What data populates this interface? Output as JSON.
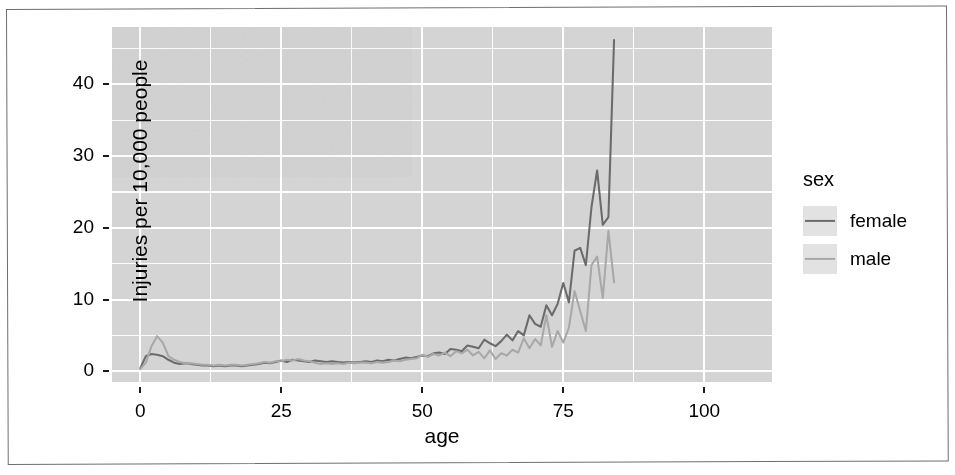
{
  "figure": {
    "background": "#ffffff",
    "panel_background": "#d4d4d4",
    "gridline_color": "#ffffff",
    "frame_color": "#6e6e6e"
  },
  "legend": {
    "title": "sex",
    "items": [
      {
        "label": "female",
        "color": "#6b6b6b",
        "key_name": "legend-key-female"
      },
      {
        "label": "male",
        "color": "#a8a8a8",
        "key_name": "legend-key-male"
      }
    ]
  },
  "axes": {
    "x_title": "age",
    "y_title": "Injuries per 10,000 people",
    "x_ticks": [
      "0",
      "25",
      "50",
      "75",
      "100"
    ],
    "y_ticks": [
      "0",
      "10",
      "20",
      "30",
      "40"
    ]
  },
  "chart_data": {
    "type": "line",
    "title": "",
    "subtitle": "",
    "xlabel": "age",
    "ylabel": "Injuries per 10,000 people",
    "xlim": [
      -5,
      112
    ],
    "ylim": [
      -1.5,
      48
    ],
    "xticks": [
      0,
      25,
      50,
      75,
      100
    ],
    "yticks": [
      0,
      10,
      20,
      30,
      40
    ],
    "x_minor_ticks": [
      12.5,
      37.5,
      62.5,
      87.5
    ],
    "y_minor_ticks": [
      5,
      15,
      25,
      35,
      45
    ],
    "grid": true,
    "legend_position": "right",
    "legend_title": "sex",
    "series": [
      {
        "name": "female",
        "color": "#6b6b6b",
        "x": [
          0,
          1,
          2,
          3,
          4,
          5,
          6,
          7,
          8,
          9,
          10,
          11,
          12,
          13,
          14,
          15,
          16,
          17,
          18,
          19,
          20,
          21,
          22,
          23,
          24,
          25,
          26,
          27,
          28,
          29,
          30,
          31,
          32,
          33,
          34,
          35,
          36,
          37,
          38,
          39,
          40,
          41,
          42,
          43,
          44,
          45,
          46,
          47,
          48,
          49,
          50,
          51,
          52,
          53,
          54,
          55,
          56,
          57,
          58,
          59,
          60,
          61,
          62,
          63,
          64,
          65,
          66,
          67,
          68,
          69,
          70,
          71,
          72,
          73,
          74,
          75,
          76,
          77,
          78,
          79,
          80,
          81,
          82,
          83,
          84
        ],
        "values": [
          0.4,
          2.1,
          2.4,
          2.3,
          2.1,
          1.6,
          1.2,
          1.0,
          1.1,
          1.0,
          0.9,
          0.8,
          0.8,
          0.7,
          0.8,
          0.7,
          0.8,
          0.8,
          0.7,
          0.8,
          0.9,
          1.0,
          1.2,
          1.1,
          1.3,
          1.5,
          1.3,
          1.6,
          1.5,
          1.4,
          1.3,
          1.5,
          1.4,
          1.3,
          1.4,
          1.3,
          1.2,
          1.3,
          1.2,
          1.3,
          1.4,
          1.3,
          1.5,
          1.4,
          1.6,
          1.5,
          1.7,
          1.9,
          1.8,
          2.0,
          2.2,
          2.1,
          2.5,
          2.6,
          2.4,
          3.1,
          3.0,
          2.8,
          3.6,
          3.4,
          3.2,
          4.4,
          3.9,
          3.5,
          4.2,
          5.1,
          4.3,
          5.6,
          5.0,
          7.8,
          6.6,
          6.2,
          9.2,
          7.8,
          9.4,
          12.3,
          9.6,
          16.8,
          17.2,
          14.8,
          22.9,
          28.0,
          20.4,
          21.5,
          46.2
        ]
      },
      {
        "name": "male",
        "color": "#a8a8a8",
        "x": [
          0,
          1,
          2,
          3,
          4,
          5,
          6,
          7,
          8,
          9,
          10,
          11,
          12,
          13,
          14,
          15,
          16,
          17,
          18,
          19,
          20,
          21,
          22,
          23,
          24,
          25,
          26,
          27,
          28,
          29,
          30,
          31,
          32,
          33,
          34,
          35,
          36,
          37,
          38,
          39,
          40,
          41,
          42,
          43,
          44,
          45,
          46,
          47,
          48,
          49,
          50,
          51,
          52,
          53,
          54,
          55,
          56,
          57,
          58,
          59,
          60,
          61,
          62,
          63,
          64,
          65,
          66,
          67,
          68,
          69,
          70,
          71,
          72,
          73,
          74,
          75,
          76,
          77,
          78,
          79,
          80,
          81,
          82,
          83,
          84
        ],
        "values": [
          0.3,
          1.2,
          3.5,
          4.9,
          4.0,
          2.1,
          1.6,
          1.3,
          1.1,
          1.1,
          1.0,
          0.9,
          0.9,
          0.8,
          0.9,
          0.8,
          0.9,
          0.9,
          0.8,
          0.9,
          1.0,
          1.1,
          1.3,
          1.2,
          1.4,
          1.4,
          1.6,
          1.5,
          1.7,
          1.5,
          1.4,
          1.2,
          1.0,
          1.1,
          1.0,
          1.1,
          1.0,
          1.2,
          1.1,
          1.2,
          1.2,
          1.1,
          1.3,
          1.2,
          1.3,
          1.5,
          1.4,
          1.6,
          1.7,
          1.8,
          2.3,
          2.0,
          2.4,
          2.2,
          2.6,
          2.1,
          2.8,
          2.5,
          3.0,
          2.2,
          2.7,
          1.8,
          2.9,
          1.7,
          2.5,
          2.2,
          3.0,
          2.6,
          4.6,
          3.2,
          4.5,
          3.6,
          7.8,
          3.4,
          5.6,
          4.0,
          6.1,
          11.2,
          8.4,
          5.6,
          14.8,
          16.0,
          10.2,
          19.6,
          12.4
        ]
      }
    ]
  }
}
